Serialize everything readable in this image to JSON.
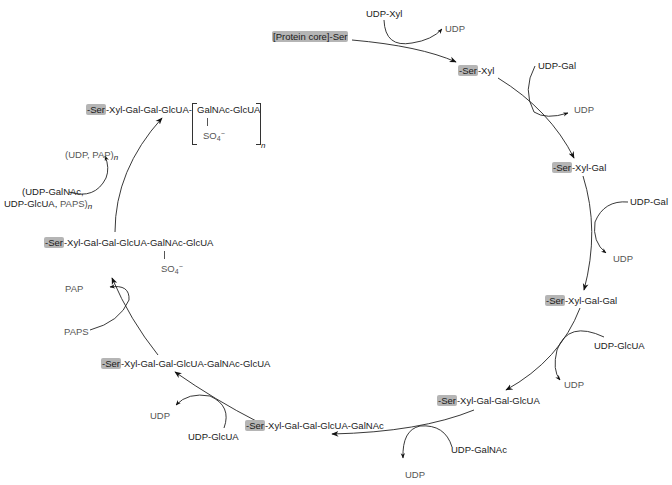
{
  "diagram": {
    "type": "cyclic biosynthesis pathway",
    "highlight_color": "#b5b5b5",
    "line_color": "#222222",
    "cofactor_text_color": "#555555"
  },
  "nodes": [
    {
      "id": "n0",
      "ser": "[Protein core]-Ser",
      "rest": ""
    },
    {
      "id": "n1",
      "ser": "-Ser",
      "rest": "-Xyl"
    },
    {
      "id": "n2",
      "ser": "-Ser",
      "rest": "-Xyl-Gal"
    },
    {
      "id": "n3",
      "ser": "-Ser",
      "rest": "-Xyl-Gal-Gal"
    },
    {
      "id": "n4",
      "ser": "-Ser",
      "rest": "-Xyl-Gal-Gal-GlcUA"
    },
    {
      "id": "n5",
      "ser": "-Ser",
      "rest": "-Xyl-Gal-Gal-GlcUA-GalNAc"
    },
    {
      "id": "n6",
      "ser": "-Ser",
      "rest": "-Xyl-Gal-Gal-GlcUA-GalNAc-GlcUA"
    },
    {
      "id": "n7",
      "ser": "-Ser",
      "rest": "-Xyl-Gal-Gal-GlcUA-GalNAc-GlcUA",
      "substituent": "SO4−",
      "sub_base": "SO",
      "sub_index": "4",
      "sub_charge": "−"
    },
    {
      "id": "n8",
      "ser": "-Ser",
      "rest": "-Xyl-Gal-Gal-GlcUA-",
      "repeat": "GalNAc-GlcUA",
      "repeat_sub_base": "SO",
      "repeat_sub_index": "4",
      "repeat_sub_charge": "−",
      "repeat_n": "n"
    }
  ],
  "steps": [
    {
      "from": "n0",
      "to": "n1",
      "donor": "UDP-Xyl",
      "product": "UDP"
    },
    {
      "from": "n1",
      "to": "n2",
      "donor": "UDP-Gal",
      "product": "UDP"
    },
    {
      "from": "n2",
      "to": "n3",
      "donor": "UDP-Gal",
      "product": "UDP"
    },
    {
      "from": "n3",
      "to": "n4",
      "donor": "UDP-GlcUA",
      "product": "UDP"
    },
    {
      "from": "n4",
      "to": "n5",
      "donor": "UDP-GalNAc",
      "product": "UDP"
    },
    {
      "from": "n5",
      "to": "n6",
      "donor": "UDP-GlcUA",
      "product": "UDP"
    },
    {
      "from": "n6",
      "to": "n7",
      "donor": "PAPS",
      "product": "PAP"
    },
    {
      "from": "n7",
      "to": "n8",
      "donor_line1": "(UDP-GalNAc,",
      "donor_line2_a": "UDP-GlcUA, ",
      "donor_line2_b": "PAPS)",
      "donor_n": "n",
      "product_a": "(UDP, ",
      "product_b": "PAP)",
      "product_n": "n"
    }
  ]
}
